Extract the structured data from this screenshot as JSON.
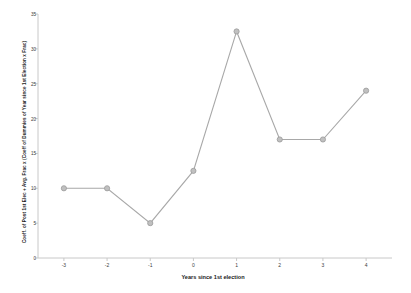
{
  "chart_data": {
    "type": "line",
    "title": "",
    "xlabel": "Years since 1st election",
    "ylabel": "Coeff. of Post 1st Elec + Avg. Frac x (Coeff of Dummies of Year since 1st Election x Frac)",
    "x": [
      -3,
      -2,
      -1,
      0,
      1,
      2,
      3,
      4
    ],
    "categories": [
      "-3",
      "-2",
      "-1",
      "0",
      "1",
      "2",
      "3",
      "4"
    ],
    "values": [
      10,
      10,
      5,
      12.5,
      32.5,
      17,
      17,
      24
    ],
    "series": [
      {
        "name": "Coefficient",
        "values": [
          10,
          10,
          5,
          12.5,
          32.5,
          17,
          17,
          24
        ]
      }
    ],
    "xlim": [
      -3.6,
      4.6
    ],
    "ylim": [
      0,
      35
    ],
    "yticks": [
      0,
      5,
      10,
      15,
      20,
      25,
      30,
      35
    ],
    "ytick_labels": [
      "0",
      "5",
      "10",
      "15",
      "20",
      "25",
      "30",
      "35"
    ],
    "xticks": [
      -3,
      -2,
      -1,
      0,
      1,
      2,
      3,
      4
    ],
    "xtick_labels": [
      "-3",
      "-2",
      "-1",
      "0",
      "1",
      "2",
      "3",
      "4"
    ],
    "grid": false,
    "legend": "none",
    "marker": "circle",
    "line_color": "#a8a8a8",
    "marker_color": "#c0c0c0",
    "marker_edge_color": "#9a9a9a",
    "axis_color": "#c8c8c8",
    "background_color": "#ffffff",
    "text_color": "#1a1a1a"
  }
}
